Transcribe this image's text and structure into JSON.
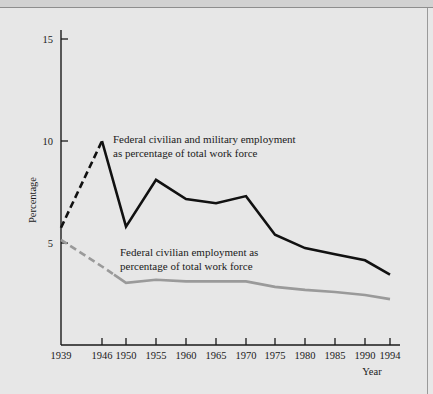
{
  "figure": {
    "background_color": "#e7e7e7",
    "top_band_color": "#d2d2d2",
    "frame_line_color": "#8e8e8e"
  },
  "chart_data": {
    "type": "line",
    "title": "",
    "xlabel": "Year",
    "ylabel": "Percentage",
    "xlim": [
      1939,
      1994
    ],
    "ylim": [
      0,
      15.6
    ],
    "grid": false,
    "legend_position": "inline-annotations",
    "x_tick_labels": [
      "1939",
      "1946",
      "1950",
      "1955",
      "1960",
      "1965",
      "1970",
      "1975",
      "1980",
      "1985",
      "1990",
      "1994"
    ],
    "x_ticks": [
      1939,
      1946,
      1950,
      1955,
      1960,
      1965,
      1970,
      1975,
      1980,
      1985,
      1990,
      1994
    ],
    "y_tick_labels": [
      "5",
      "10",
      "15"
    ],
    "y_ticks": [
      5,
      10,
      15
    ],
    "series": [
      {
        "name": "Federal civilian and military employment as percentage of total work force",
        "color": "#111111",
        "width": 2.6,
        "annotation_line1": "Federal civilian and military employment",
        "annotation_line2": "as percentage of total work force",
        "x": [
          1939,
          1946,
          1950,
          1955,
          1960,
          1965,
          1970,
          1975,
          1980,
          1985,
          1990,
          1994
        ],
        "values": [
          5.75,
          10.0,
          5.8,
          8.1,
          7.15,
          6.95,
          7.3,
          5.4,
          4.75,
          4.45,
          4.15,
          3.45
        ],
        "dashed_until": 1946
      },
      {
        "name": "Federal civilian employment as percentage of total work force",
        "color": "#9a9a9a",
        "width": 2.6,
        "annotation_line1": "Federal civilian employment as",
        "annotation_line2": "percentage of total work force",
        "x": [
          1939,
          1946,
          1950,
          1955,
          1960,
          1965,
          1970,
          1975,
          1980,
          1985,
          1990,
          1994
        ],
        "values": [
          5.15,
          3.85,
          3.05,
          3.2,
          3.12,
          3.12,
          3.12,
          2.85,
          2.7,
          2.6,
          2.45,
          2.25
        ],
        "dashed_until": 1948
      }
    ]
  }
}
